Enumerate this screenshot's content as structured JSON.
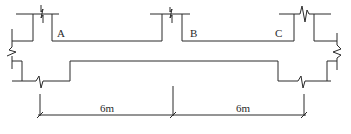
{
  "diagram": {
    "type": "structural-frame-plan",
    "joint_labels": {
      "a": "A",
      "b": "B",
      "c": "C"
    },
    "dimensions": [
      {
        "label": "6m",
        "from": "A",
        "to": "B"
      },
      {
        "label": "6m",
        "from": "B",
        "to": "C"
      }
    ],
    "colors": {
      "line": "#2a2a2a",
      "background": "#ffffff"
    }
  }
}
